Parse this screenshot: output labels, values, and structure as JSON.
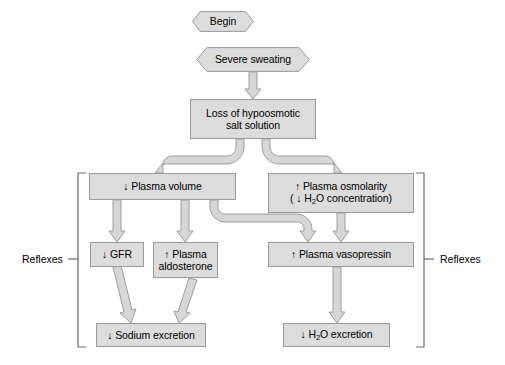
{
  "diagram": {
    "colors": {
      "node_fill": "#dcdcdc",
      "node_border": "#9a9a9a",
      "arrow_fill": "#d4d4d4",
      "arrow_border": "#9a9a9a",
      "bracket": "#555555",
      "text": "#000000",
      "background": "#ffffff"
    },
    "nodes": [
      {
        "id": "begin",
        "shape": "hexagon",
        "label": "Begin",
        "x": 192,
        "y": 11,
        "w": 62,
        "h": 21
      },
      {
        "id": "sweating",
        "shape": "hexagon",
        "label": "Severe sweating",
        "x": 196,
        "y": 47,
        "w": 114,
        "h": 25
      },
      {
        "id": "loss",
        "shape": "rectangle",
        "line1": "Loss of hypoosmotic",
        "line2": "salt solution",
        "x": 190,
        "y": 99,
        "w": 126,
        "h": 40
      },
      {
        "id": "plasmavol",
        "shape": "rectangle",
        "label": "↓ Plasma volume",
        "x": 89,
        "y": 173,
        "w": 147,
        "h": 27
      },
      {
        "id": "osmolarity",
        "shape": "rectangle",
        "line1": "↑ Plasma osmolarity",
        "line2": "( ↓ H2O concentration)",
        "x": 268,
        "y": 173,
        "w": 146,
        "h": 40
      },
      {
        "id": "gfr",
        "shape": "rectangle",
        "label": "↓ GFR",
        "x": 90,
        "y": 242,
        "w": 54,
        "h": 25
      },
      {
        "id": "aldosterone",
        "shape": "rectangle",
        "line1": "↑ Plasma",
        "line2": "aldosterone",
        "x": 153,
        "y": 242,
        "w": 65,
        "h": 36
      },
      {
        "id": "vasopressin",
        "shape": "rectangle",
        "label": "↑ Plasma vasopressin",
        "x": 268,
        "y": 242,
        "w": 146,
        "h": 25
      },
      {
        "id": "sodiumexc",
        "shape": "rectangle",
        "label": "↓ Sodium excretion",
        "x": 96,
        "y": 323,
        "w": 110,
        "h": 24
      },
      {
        "id": "h2oexc",
        "shape": "rectangle",
        "label": "↓ H2O excretion",
        "x": 283,
        "y": 323,
        "w": 107,
        "h": 24
      }
    ],
    "edges": [
      {
        "from": "sweating",
        "to": "loss",
        "style": "straight-down"
      },
      {
        "from": "loss",
        "to": "plasmavol",
        "style": "elbow-left"
      },
      {
        "from": "loss",
        "to": "osmolarity",
        "style": "elbow-right"
      },
      {
        "from": "plasmavol",
        "to": "gfr",
        "style": "straight-down"
      },
      {
        "from": "plasmavol",
        "to": "aldosterone",
        "style": "straight-down"
      },
      {
        "from": "plasmavol",
        "to": "vasopressin",
        "style": "elbow-right-down"
      },
      {
        "from": "osmolarity",
        "to": "vasopressin",
        "style": "straight-down"
      },
      {
        "from": "gfr",
        "to": "sodiumexc",
        "style": "straight-down"
      },
      {
        "from": "aldosterone",
        "to": "sodiumexc",
        "style": "straight-down"
      },
      {
        "from": "vasopressin",
        "to": "h2oexc",
        "style": "straight-down"
      }
    ],
    "brackets": [
      {
        "id": "left",
        "label": "Reflexes",
        "label_x": 22,
        "label_y": 254,
        "x": 78,
        "y_top": 173,
        "y_bottom": 347,
        "side": "left"
      },
      {
        "id": "right",
        "label": "Reflexes",
        "label_x": 435,
        "label_y": 254,
        "x": 424,
        "y_top": 173,
        "y_bottom": 347,
        "side": "right"
      }
    ]
  }
}
